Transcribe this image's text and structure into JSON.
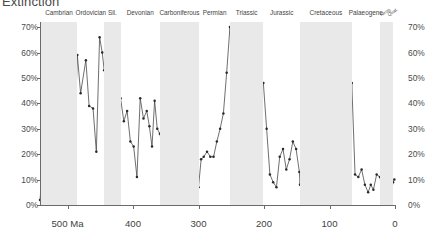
{
  "title": "Extinction",
  "axes": {
    "y_unit": "%",
    "y_ticks": [
      0,
      10,
      20,
      30,
      40,
      50,
      60,
      70
    ],
    "y_tick_labels": [
      "0%",
      "10%",
      "20%",
      "30%",
      "40%",
      "50%",
      "60%",
      "70%"
    ],
    "x_ticks": [
      500,
      400,
      300,
      200,
      100,
      0
    ],
    "x_tick_labels": [
      "500 Ma",
      "400",
      "300",
      "200",
      "100",
      "0"
    ],
    "x_label": "",
    "y_label": ""
  },
  "periods": [
    {
      "name": "Cambrian",
      "start": 541,
      "end": 485,
      "shaded": true
    },
    {
      "name": "Ordovician",
      "start": 485,
      "end": 444,
      "shaded": false
    },
    {
      "name": "Sil.",
      "start": 444,
      "end": 419,
      "shaded": true
    },
    {
      "name": "Devonian",
      "start": 419,
      "end": 359,
      "shaded": false
    },
    {
      "name": "Carboniferous",
      "start": 359,
      "end": 299,
      "shaded": true
    },
    {
      "name": "Permian",
      "start": 299,
      "end": 252,
      "shaded": false
    },
    {
      "name": "Triassic",
      "start": 252,
      "end": 201,
      "shaded": true
    },
    {
      "name": "Jurassic",
      "start": 201,
      "end": 145,
      "shaded": false
    },
    {
      "name": "Cretaceous",
      "start": 145,
      "end": 66,
      "shaded": true
    },
    {
      "name": "Palaeogene",
      "start": 66,
      "end": 23,
      "shaded": false
    },
    {
      "name": "Neog.",
      "start": 23,
      "end": 2.6,
      "shaded": true
    },
    {
      "name": "Quat.",
      "start": 2.6,
      "end": 0,
      "shaded": false
    }
  ],
  "chart_data": {
    "type": "line",
    "title": "Extinction",
    "xlabel": "",
    "ylabel": "",
    "xlim": [
      542,
      0
    ],
    "ylim": [
      0,
      72
    ],
    "x_reversed": true,
    "grid": false,
    "legend": false,
    "marker": "circle",
    "line_color": "#4a4a4a",
    "marker_color": "#2b2b2b",
    "band_color": "#e9e9e9",
    "series": [
      {
        "name": "Extinction intensity (marine genera)",
        "x": [
          542,
          534,
          527,
          521,
          514,
          509,
          504,
          499,
          494,
          489,
          485,
          480,
          472,
          467,
          461,
          456,
          451,
          447,
          444,
          441,
          437,
          433,
          429,
          425,
          421,
          419,
          414,
          409,
          404,
          399,
          394,
          389,
          384,
          379,
          375,
          371,
          367,
          363,
          359,
          355,
          350,
          345,
          340,
          335,
          330,
          325,
          320,
          315,
          310,
          305,
          300,
          296,
          292,
          287,
          282,
          277,
          272,
          267,
          262,
          257,
          252,
          248,
          244,
          240,
          235,
          230,
          225,
          220,
          215,
          210,
          205,
          201,
          196,
          191,
          186,
          181,
          176,
          171,
          166,
          161,
          156,
          151,
          146,
          145,
          140,
          134,
          128,
          122,
          116,
          110,
          104,
          98,
          93,
          89,
          85,
          80,
          75,
          70,
          66,
          61,
          56,
          51,
          46,
          41,
          37,
          33,
          28,
          23,
          18,
          14,
          10,
          6,
          3,
          1
        ],
        "y": [
          2,
          26,
          15,
          55,
          56,
          31,
          57,
          48,
          48,
          26,
          59,
          44,
          57,
          39,
          38,
          21,
          66,
          60,
          53,
          49,
          42,
          38,
          36,
          32,
          30,
          42,
          33,
          37,
          25,
          23,
          11,
          42,
          34,
          37,
          31,
          23,
          41,
          30,
          28,
          23,
          25,
          21,
          23,
          14,
          16,
          9,
          11,
          9,
          14,
          9,
          7,
          18,
          19,
          21,
          19,
          19,
          25,
          30,
          36,
          52,
          70,
          53,
          33,
          14,
          15,
          17,
          27,
          20,
          15,
          23,
          47,
          48,
          30,
          12,
          9,
          7,
          19,
          22,
          14,
          18,
          25,
          22,
          13,
          8,
          23,
          20,
          11,
          10,
          6,
          15,
          9,
          17,
          23,
          12,
          10,
          9,
          13,
          13,
          48,
          12,
          11,
          14,
          8,
          5,
          8,
          6,
          12,
          11,
          3,
          14,
          9,
          4,
          9,
          10
        ]
      }
    ],
    "notable_events": [
      {
        "label": "End-Ordovician",
        "x": 444,
        "y": 53
      },
      {
        "label": "Late Devonian",
        "x": 372,
        "y": 41
      },
      {
        "label": "End-Permian",
        "x": 252,
        "y": 70
      },
      {
        "label": "End-Triassic",
        "x": 201,
        "y": 48
      },
      {
        "label": "End-Cretaceous",
        "x": 66,
        "y": 48
      }
    ]
  }
}
